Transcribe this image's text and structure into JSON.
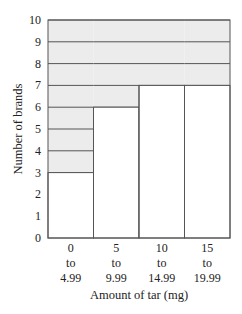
{
  "chart_data": {
    "type": "bar",
    "title": "",
    "xlabel": "Amount of tar (mg)",
    "ylabel": "Number of brands",
    "categories": [
      "0 to 4.99",
      "5 to 9.99",
      "10 to 14.99",
      "15 to 19.99"
    ],
    "category_lines": [
      [
        "0",
        "to",
        "4.99"
      ],
      [
        "5",
        "to",
        "9.99"
      ],
      [
        "10",
        "to",
        "14.99"
      ],
      [
        "15",
        "to",
        "19.99"
      ]
    ],
    "values": [
      3,
      6,
      7,
      7
    ],
    "ylim": [
      0,
      10
    ],
    "yticks": [
      0,
      1,
      2,
      3,
      4,
      5,
      6,
      7,
      8,
      9,
      10
    ],
    "grid": false,
    "legend": null,
    "style": "Bars are white outlined columns; the region above each bar up to 10 is shaded light gray with horizontal lines at each integer."
  },
  "colors": {
    "shade": "#ececec",
    "line": "#555555",
    "bar": "#ffffff"
  }
}
